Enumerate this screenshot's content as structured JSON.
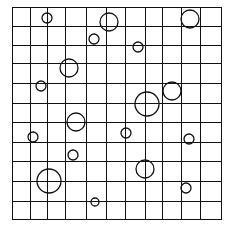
{
  "figure": {
    "width": 225,
    "height": 227,
    "background": "#ffffff",
    "stroke_color": "#111111",
    "grid": {
      "x_lines": [
        12,
        30,
        47,
        65,
        86,
        106,
        125,
        145,
        162,
        181,
        200,
        221
      ],
      "y_lines": [
        7,
        26,
        45,
        63,
        83,
        103,
        122,
        142,
        161,
        181,
        201,
        219
      ],
      "columns": 11,
      "rows": 11,
      "line_width": 1
    },
    "circles": [
      {
        "cx": 47,
        "cy": 18,
        "r": 5
      },
      {
        "cx": 109,
        "cy": 22,
        "r": 9
      },
      {
        "cx": 190,
        "cy": 19,
        "r": 9
      },
      {
        "cx": 94,
        "cy": 39,
        "r": 5
      },
      {
        "cx": 138,
        "cy": 47,
        "r": 5
      },
      {
        "cx": 69,
        "cy": 68,
        "r": 9
      },
      {
        "cx": 41,
        "cy": 86,
        "r": 5
      },
      {
        "cx": 172,
        "cy": 91,
        "r": 9
      },
      {
        "cx": 147,
        "cy": 104,
        "r": 12
      },
      {
        "cx": 76,
        "cy": 122,
        "r": 9
      },
      {
        "cx": 126,
        "cy": 133,
        "r": 5
      },
      {
        "cx": 33,
        "cy": 137,
        "r": 5
      },
      {
        "cx": 189,
        "cy": 139,
        "r": 5
      },
      {
        "cx": 73,
        "cy": 155,
        "r": 5
      },
      {
        "cx": 145,
        "cy": 169,
        "r": 9
      },
      {
        "cx": 49,
        "cy": 181,
        "r": 12
      },
      {
        "cx": 186,
        "cy": 188,
        "r": 5
      },
      {
        "cx": 95,
        "cy": 202,
        "r": 4
      }
    ]
  }
}
